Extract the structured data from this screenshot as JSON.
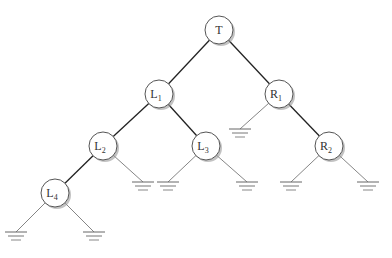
{
  "diagram": {
    "type": "binary-tree",
    "nodes": [
      {
        "id": "T",
        "label": "T",
        "sub": "",
        "x": 219,
        "y": 30
      },
      {
        "id": "L1",
        "label": "L",
        "sub": "1",
        "x": 159,
        "y": 94,
        "color": "#3a6a3a"
      },
      {
        "id": "R1",
        "label": "R",
        "sub": "1",
        "x": 279,
        "y": 94
      },
      {
        "id": "L2",
        "label": "L",
        "sub": "2",
        "x": 103,
        "y": 146
      },
      {
        "id": "L3",
        "label": "L",
        "sub": "3",
        "x": 206,
        "y": 146
      },
      {
        "id": "R2",
        "label": "R",
        "sub": "2",
        "x": 329,
        "y": 146
      },
      {
        "id": "L4",
        "label": "L",
        "sub": "4",
        "x": 55,
        "y": 193
      }
    ],
    "edges": [
      {
        "from": "T",
        "to": "L1",
        "bold": true
      },
      {
        "from": "T",
        "to": "R1",
        "bold": true
      },
      {
        "from": "L1",
        "to": "L2",
        "bold": true
      },
      {
        "from": "L1",
        "to": "L3",
        "bold": true
      },
      {
        "from": "R1",
        "to": "R2",
        "bold": true
      },
      {
        "from": "L2",
        "to": "L4",
        "bold": true
      }
    ],
    "grounds": [
      {
        "parent": "R1",
        "x": 240,
        "y": 129
      },
      {
        "parent": "L2",
        "x": 143,
        "y": 182
      },
      {
        "parent": "L3",
        "x": 168,
        "y": 182
      },
      {
        "parent": "L3",
        "x": 247,
        "y": 182
      },
      {
        "parent": "R2",
        "x": 291,
        "y": 182
      },
      {
        "parent": "R2",
        "x": 368,
        "y": 182
      },
      {
        "parent": "L4",
        "x": 16,
        "y": 232
      },
      {
        "parent": "L4",
        "x": 94,
        "y": 232
      }
    ],
    "node_radius": 14,
    "colors": {
      "stroke": "#555555",
      "edge": "#222222",
      "thin_edge": "#777777",
      "shadow": "#999999"
    }
  }
}
